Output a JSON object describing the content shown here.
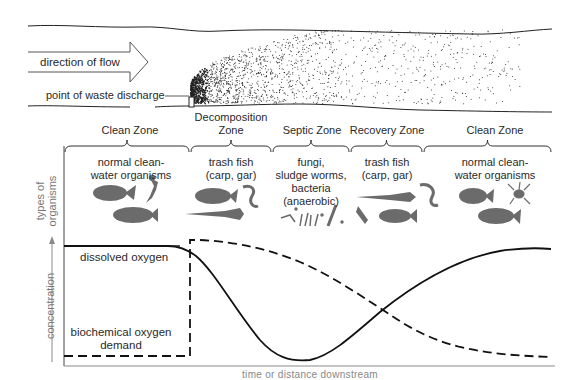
{
  "stream": {
    "flow_label": "direction of flow",
    "discharge_label": "point of waste discharge"
  },
  "zones": [
    {
      "label": "Clean Zone",
      "x_start": 64,
      "x_end": 190
    },
    {
      "label": "Decomposition Zone",
      "label_line1": "Decomposition",
      "label_line2": "Zone",
      "x_start": 190,
      "x_end": 272
    },
    {
      "label": "Septic Zone",
      "x_start": 272,
      "x_end": 350
    },
    {
      "label": "Recovery Zone",
      "x_start": 350,
      "x_end": 423
    },
    {
      "label": "Clean Zone",
      "x_start": 423,
      "x_end": 552
    }
  ],
  "organisms": {
    "axis_label_line1": "types of",
    "axis_label_line2": "organisms",
    "zones": [
      {
        "line1": "normal clean-",
        "line2": "water organisms"
      },
      {
        "line1": "trash fish",
        "line2": "(carp, gar)"
      },
      {
        "line1": "fungi,",
        "line2": "sludge worms,",
        "line3": "bacteria",
        "line4": "(anaerobic)"
      },
      {
        "line1": "trash fish",
        "line2": "(carp, gar)"
      },
      {
        "line1": "normal clean-",
        "line2": "water organisms"
      }
    ]
  },
  "chart_data": {
    "type": "line",
    "title": "",
    "xlabel": "time or distance downstream",
    "ylabel": "concentration",
    "grid": false,
    "x_range": [
      0,
      100
    ],
    "y_range": [
      0,
      100
    ],
    "series": [
      {
        "name": "dissolved oxygen",
        "style": "solid",
        "x": [
          0,
          30,
          35,
          40,
          50,
          55,
          60,
          65,
          70,
          80,
          90,
          100
        ],
        "y": [
          95,
          95,
          90,
          75,
          30,
          5,
          2,
          10,
          25,
          65,
          88,
          92
        ]
      },
      {
        "name": "biochemical oxygen demand",
        "line1": "biochemical oxygen",
        "line2": "demand",
        "style": "dashed",
        "x": [
          0,
          26,
          26,
          30,
          40,
          50,
          60,
          65,
          70,
          80,
          90,
          100
        ],
        "y": [
          2,
          2,
          100,
          99,
          93,
          80,
          55,
          42,
          30,
          15,
          7,
          5
        ]
      }
    ],
    "annotations": [
      "Clean Zone",
      "Decomposition Zone",
      "Septic Zone",
      "Recovery Zone",
      "Clean Zone"
    ]
  },
  "colors": {
    "ink": "#1a1a1a",
    "organism": "#6b6b6b",
    "axis": "#8a8a8a"
  }
}
